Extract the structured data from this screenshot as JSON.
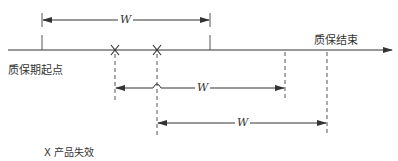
{
  "diagram": {
    "type": "warranty-period-timeline",
    "labels": {
      "start": "质保期起点",
      "end": "质保结束",
      "legend": "X 产品失效",
      "window": "W"
    },
    "axis": {
      "y": 50,
      "x_start": 8,
      "x_end": 392
    },
    "failure_marks": [
      {
        "symbol": "X",
        "x": 115
      },
      {
        "symbol": "X",
        "x": 157
      }
    ],
    "intervals": [
      {
        "label": "W",
        "x1": 42,
        "x2": 210,
        "y": 20
      },
      {
        "label": "W",
        "x1": 115,
        "x2": 285,
        "y": 88
      },
      {
        "label": "W",
        "x1": 157,
        "x2": 327,
        "y": 123
      }
    ],
    "colors": {
      "line": "#333333",
      "background": "#ffffff"
    }
  }
}
